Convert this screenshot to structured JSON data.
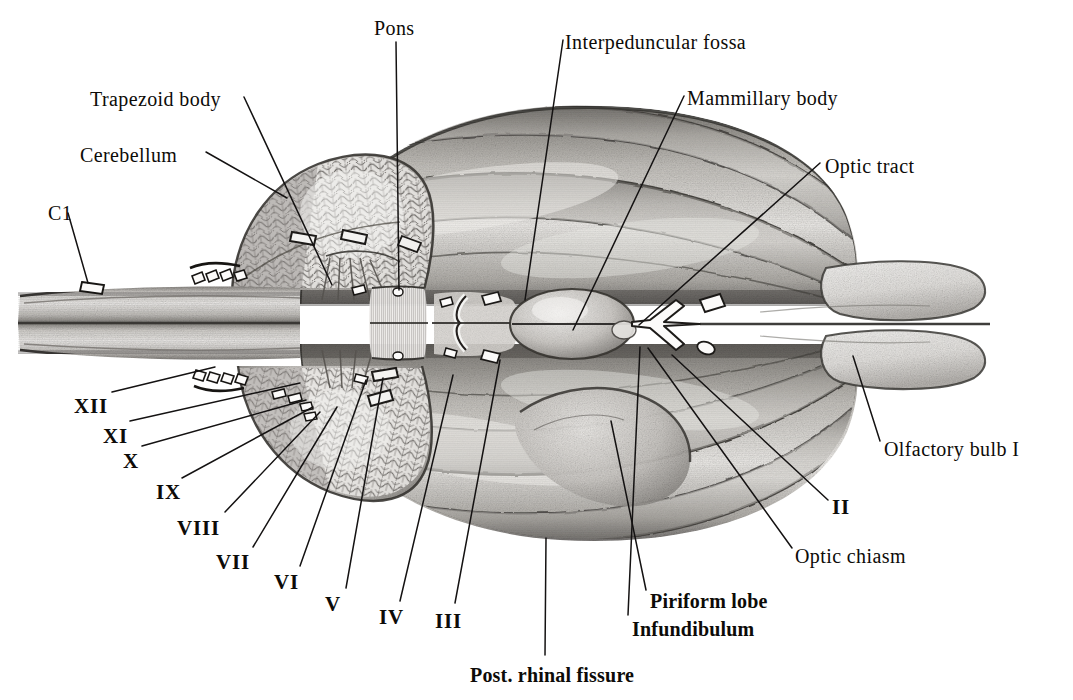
{
  "figure": {
    "background_color": "#ffffff",
    "ink_color": "#121010",
    "leader_line_color": "#141212",
    "shading_style": "graphite-pencil"
  },
  "labels": [
    {
      "id": "pons",
      "text": "Pons",
      "x": 374,
      "y": 18,
      "anchor": "start",
      "style": "plain"
    },
    {
      "id": "interpeduncular-fossa",
      "text": "Interpeduncular fossa",
      "x": 565,
      "y": 32,
      "anchor": "start",
      "style": "plain"
    },
    {
      "id": "mammillary-body",
      "text": "Mammillary body",
      "x": 687,
      "y": 88,
      "anchor": "start",
      "style": "plain"
    },
    {
      "id": "trapezoid-body",
      "text": "Trapezoid body",
      "x": 90,
      "y": 89,
      "anchor": "start",
      "style": "plain"
    },
    {
      "id": "cerebellum",
      "text": "Cerebellum",
      "x": 80,
      "y": 145,
      "anchor": "start",
      "style": "plain"
    },
    {
      "id": "optic-tract",
      "text": "Optic tract",
      "x": 825,
      "y": 156,
      "anchor": "start",
      "style": "plain"
    },
    {
      "id": "c1",
      "text": "C1",
      "x": 48,
      "y": 203,
      "anchor": "start",
      "style": "plain"
    },
    {
      "id": "olfactory-bulb-i",
      "text": "Olfactory bulb I",
      "x": 884,
      "y": 439,
      "anchor": "start",
      "style": "plain"
    },
    {
      "id": "cn-xii",
      "text": "XII",
      "x": 74,
      "y": 396,
      "anchor": "start",
      "style": "roman"
    },
    {
      "id": "cn-xi",
      "text": "XI",
      "x": 103,
      "y": 426,
      "anchor": "start",
      "style": "roman"
    },
    {
      "id": "cn-x",
      "text": "X",
      "x": 123,
      "y": 451,
      "anchor": "start",
      "style": "roman"
    },
    {
      "id": "cn-ix",
      "text": "IX",
      "x": 156,
      "y": 482,
      "anchor": "start",
      "style": "roman"
    },
    {
      "id": "cn-viii",
      "text": "VIII",
      "x": 177,
      "y": 518,
      "anchor": "start",
      "style": "roman"
    },
    {
      "id": "cn-vii",
      "text": "VII",
      "x": 216,
      "y": 552,
      "anchor": "start",
      "style": "roman"
    },
    {
      "id": "cn-vi",
      "text": "VI",
      "x": 274,
      "y": 572,
      "anchor": "start",
      "style": "roman"
    },
    {
      "id": "cn-v",
      "text": "V",
      "x": 325,
      "y": 594,
      "anchor": "start",
      "style": "roman"
    },
    {
      "id": "cn-iv",
      "text": "IV",
      "x": 379,
      "y": 607,
      "anchor": "start",
      "style": "roman"
    },
    {
      "id": "cn-iii",
      "text": "III",
      "x": 435,
      "y": 611,
      "anchor": "start",
      "style": "roman"
    },
    {
      "id": "cn-ii",
      "text": "II",
      "x": 832,
      "y": 497,
      "anchor": "start",
      "style": "roman"
    },
    {
      "id": "optic-chiasm",
      "text": "Optic chiasm",
      "x": 795,
      "y": 546,
      "anchor": "start",
      "style": "plain"
    },
    {
      "id": "piriform-lobe",
      "text": "Piriform lobe",
      "x": 650,
      "y": 591,
      "anchor": "start",
      "style": "bold"
    },
    {
      "id": "infundibulum",
      "text": "Infundibulum",
      "x": 632,
      "y": 619,
      "anchor": "start",
      "style": "bold"
    },
    {
      "id": "post-rhinal-fissure",
      "text": "Post. rhinal fissure",
      "x": 470,
      "y": 665,
      "anchor": "start",
      "style": "bold"
    }
  ],
  "leader_lines": [
    {
      "id": "pons",
      "points": "396,42 399,290"
    },
    {
      "id": "interpeduncular-fossa",
      "points": "563,40 525,300"
    },
    {
      "id": "mammillary-body",
      "points": "684,96 573,330"
    },
    {
      "id": "trapezoid-body",
      "points": "244,97 332,285"
    },
    {
      "id": "cerebellum",
      "points": "206,152 287,198"
    },
    {
      "id": "optic-tract",
      "points": "820,163 639,325"
    },
    {
      "id": "c1",
      "points": "68,213 88,283"
    },
    {
      "id": "olfactory-bulb-i",
      "points": "880,441 853,356"
    },
    {
      "id": "cn-xii",
      "points": "112,392 215,367"
    },
    {
      "id": "cn-xi",
      "points": "130,421 300,383"
    },
    {
      "id": "cn-x",
      "points": "142,446 306,400"
    },
    {
      "id": "cn-ix",
      "points": "182,478 313,407"
    },
    {
      "id": "cn-viii",
      "points": "225,512 320,412"
    },
    {
      "id": "cn-vii",
      "points": "253,547 337,407"
    },
    {
      "id": "cn-vi",
      "points": "300,566 366,380"
    },
    {
      "id": "cn-v",
      "points": "346,588 383,378"
    },
    {
      "id": "cn-iv",
      "points": "400,601 453,375"
    },
    {
      "id": "cn-iii",
      "points": "455,603 500,360"
    },
    {
      "id": "cn-ii",
      "points": "828,500 672,355"
    },
    {
      "id": "optic-chiasm",
      "points": "792,548 648,348"
    },
    {
      "id": "piriform-lobe",
      "points": "646,590 611,421"
    },
    {
      "id": "infundibulum",
      "points": "628,615 640,347"
    },
    {
      "id": "post-rhinal-fissure",
      "points": "545,655 546,538"
    }
  ],
  "structures": [
    {
      "id": "cerebral-hemisphere-upper",
      "name": "cerebral hemisphere (upper)"
    },
    {
      "id": "cerebral-hemisphere-lower",
      "name": "cerebral hemisphere (lower)"
    },
    {
      "id": "cerebellum-upper",
      "name": "cerebellum (upper)"
    },
    {
      "id": "cerebellum-lower",
      "name": "cerebellum (lower)"
    },
    {
      "id": "medulla-oblongata",
      "name": "medulla oblongata"
    },
    {
      "id": "spinal-cord",
      "name": "spinal cord"
    },
    {
      "id": "pons-body",
      "name": "pons"
    },
    {
      "id": "optic-chiasm-body",
      "name": "optic chiasm"
    },
    {
      "id": "mammillary-body-shape",
      "name": "mammillary body"
    },
    {
      "id": "olfactory-bulb-upper",
      "name": "olfactory bulb (upper)"
    },
    {
      "id": "olfactory-bulb-lower",
      "name": "olfactory bulb (lower)"
    },
    {
      "id": "piriform-lobe-shape",
      "name": "piriform lobe"
    },
    {
      "id": "infundibulum-shape",
      "name": "infundibulum"
    }
  ]
}
